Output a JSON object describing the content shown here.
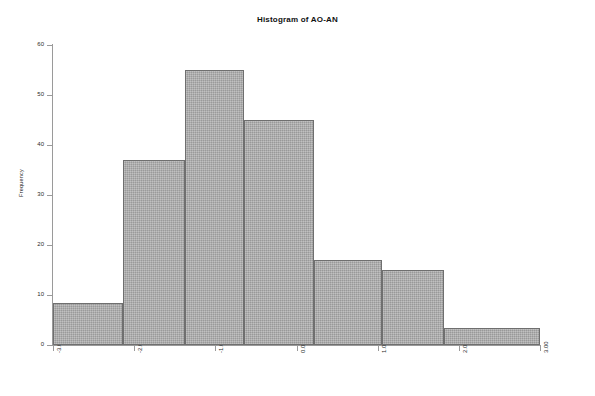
{
  "chart_data": {
    "type": "bar",
    "title": "Histogram of AO-AN",
    "xlabel": "",
    "ylabel": "Frequency",
    "categories": [
      "-3.00 to -2.50",
      "-2.50 to -1.75",
      "-1.75 to -1.15",
      "-1.15 to -0.45",
      "-0.45 to 0.40",
      "0.40 to 1.40",
      "1.40 to 2.45"
    ],
    "bin_edges": [
      -3.0,
      -2.15,
      -1.4,
      -0.65,
      0.1,
      0.85,
      1.95,
      2.55,
      3.0
    ],
    "values": [
      8.5,
      37,
      55,
      45,
      17,
      15,
      3.5
    ],
    "bars": [
      {
        "x_start": -3.0,
        "x_end": -2.14,
        "value": 8.5
      },
      {
        "x_start": -2.14,
        "x_end": -1.37,
        "value": 37
      },
      {
        "x_start": -1.37,
        "x_end": -0.65,
        "value": 55
      },
      {
        "x_start": -0.65,
        "x_end": 0.22,
        "value": 45
      },
      {
        "x_start": 0.22,
        "x_end": 1.05,
        "value": 17
      },
      {
        "x_start": 1.05,
        "x_end": 1.82,
        "value": 15
      },
      {
        "x_start": 1.82,
        "x_end": 3.0,
        "value": 3.5
      }
    ],
    "xlim": [
      -3.0,
      3.0
    ],
    "ylim": [
      0,
      60
    ],
    "x_ticks": [
      {
        "value": -3.0,
        "label": "-3.00"
      },
      {
        "value": -2.0,
        "label": "-2.00"
      },
      {
        "value": -1.0,
        "label": "-1.00"
      },
      {
        "value": 0.0,
        "label": "0.00"
      },
      {
        "value": 1.0,
        "label": "1.00"
      },
      {
        "value": 2.0,
        "label": "2.00"
      },
      {
        "value": 3.0,
        "label": "3.00"
      }
    ],
    "y_ticks": [
      {
        "value": 0,
        "label": "0"
      },
      {
        "value": 10,
        "label": "10"
      },
      {
        "value": 20,
        "label": "20"
      },
      {
        "value": 30,
        "label": "30"
      },
      {
        "value": 40,
        "label": "40"
      },
      {
        "value": 50,
        "label": "50"
      },
      {
        "value": 60,
        "label": "60"
      }
    ],
    "grid": false,
    "legend": null,
    "colors": {
      "bar_fill": "#a8a8a8",
      "bar_border": "#6f6f6f",
      "axis": "#9a9a9a",
      "text": "#2b2b2b",
      "background": "#ffffff"
    }
  }
}
